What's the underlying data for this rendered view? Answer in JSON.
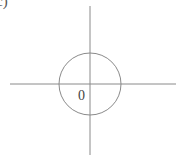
{
  "figure": {
    "panel_label": "c)",
    "origin_label": "0",
    "stroke_color": "#8a8a8a",
    "axes": {
      "center": [
        90,
        84
      ],
      "horizontal": {
        "x1": 10,
        "x2": 176
      },
      "vertical": {
        "y1": 6,
        "y2": 155
      }
    },
    "circle": {
      "cx": 90,
      "cy": 84,
      "r": 31
    }
  }
}
